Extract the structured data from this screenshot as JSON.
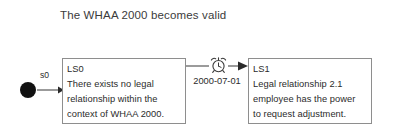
{
  "diagram": {
    "title": "The WHAA 2000 becomes valid",
    "type": "state-transition-diagram",
    "initial_state": {
      "label": "s0",
      "marker": "filled-circle"
    },
    "states": [
      {
        "id": "LS0",
        "lines": [
          "LS0",
          "There exists no legal",
          "relationship within the",
          "context of WHAA 2000."
        ]
      },
      {
        "id": "LS1",
        "lines": [
          "LS1",
          "Legal relationship 2.1",
          "employee has the power",
          "to request adjustment."
        ]
      }
    ],
    "transition": {
      "from": "LS0",
      "to": "LS1",
      "label": "2000-07-01",
      "icon": "alarm-clock-icon"
    },
    "colors": {
      "background": "#ffffff",
      "text": "#2b2b2b",
      "title_text": "#3b3b3b",
      "box_border": "#8e8e8e",
      "edge": "#4a4a4a",
      "initial_marker": "#111111"
    }
  }
}
